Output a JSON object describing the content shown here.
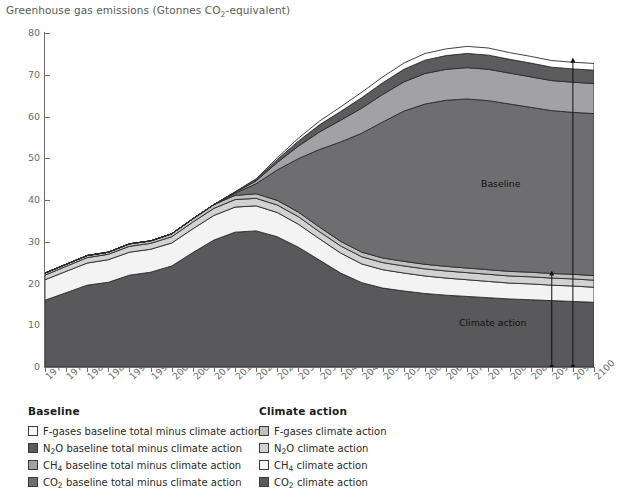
{
  "chart_data": {
    "type": "area",
    "title": "Greenhouse gas emissions (Gtonnes CO2-equivalent)",
    "title_rich": {
      "pre": "Greenhouse gas emissions (Gtonnes CO",
      "sub": "2",
      "post": "-equivalent)"
    },
    "xlabel": "",
    "ylabel": "",
    "ylim": [
      0,
      80
    ],
    "xlim": [
      1970,
      2100
    ],
    "ytick_step": 10,
    "yticks": [
      0,
      10,
      20,
      30,
      40,
      50,
      60,
      70,
      80
    ],
    "grid": false,
    "stacked": true,
    "legend_position": "below-plot",
    "x": [
      1970,
      1975,
      1980,
      1985,
      1990,
      1995,
      2000,
      2005,
      2010,
      2015,
      2020,
      2025,
      2030,
      2035,
      2040,
      2045,
      2050,
      2055,
      2060,
      2065,
      2070,
      2075,
      2080,
      2085,
      2090,
      2095,
      2100
    ],
    "xtick_labels": [
      "1970",
      "1975",
      "1980",
      "1985",
      "1990",
      "1995",
      "2000",
      "2005",
      "2010",
      "2015",
      "2020",
      "2025",
      "2030",
      "2035",
      "2040",
      "2045",
      "2050",
      "2055",
      "2060",
      "2065",
      "2070",
      "2075",
      "2080",
      "2085",
      "2090",
      "2095",
      "2100"
    ],
    "series": [
      {
        "name": "CO2 climate action",
        "key": "co2_climate",
        "color": "#59595b",
        "values": [
          16.0,
          17.8,
          19.6,
          20.3,
          22.0,
          22.7,
          24.2,
          27.4,
          30.4,
          32.3,
          32.6,
          31.2,
          28.7,
          25.6,
          22.5,
          20.2,
          18.9,
          18.2,
          17.6,
          17.2,
          16.9,
          16.6,
          16.3,
          16.1,
          15.9,
          15.7,
          15.5
        ]
      },
      {
        "name": "CH4 climate action",
        "key": "ch4_climate",
        "color": "#f3f3f3",
        "values": [
          4.9,
          5.1,
          5.3,
          5.4,
          5.5,
          5.5,
          5.5,
          5.7,
          5.9,
          6.0,
          6.0,
          5.8,
          5.5,
          5.1,
          4.8,
          4.5,
          4.4,
          4.3,
          4.2,
          4.1,
          4.0,
          3.9,
          3.8,
          3.8,
          3.7,
          3.7,
          3.6
        ]
      },
      {
        "name": "N2O climate action",
        "key": "n2o_climate",
        "color": "#d2d2d2",
        "values": [
          1.1,
          1.2,
          1.3,
          1.3,
          1.4,
          1.4,
          1.5,
          1.6,
          1.7,
          1.8,
          1.8,
          1.8,
          1.8,
          1.7,
          1.7,
          1.7,
          1.7,
          1.7,
          1.7,
          1.7,
          1.7,
          1.7,
          1.7,
          1.7,
          1.7,
          1.7,
          1.7
        ]
      },
      {
        "name": "F-gases climate action",
        "key": "fgas_climate",
        "color": "#c0c0c0",
        "values": [
          0.5,
          0.5,
          0.5,
          0.5,
          0.6,
          0.6,
          0.7,
          0.8,
          0.9,
          1.0,
          1.1,
          1.1,
          1.1,
          1.1,
          1.1,
          1.1,
          1.1,
          1.1,
          1.1,
          1.1,
          1.1,
          1.1,
          1.1,
          1.1,
          1.1,
          1.1,
          1.1
        ]
      },
      {
        "name": "CO2 baseline total minus climate action",
        "key": "co2_baseline_minus",
        "color": "#6e6e70",
        "values": [
          0.0,
          0.0,
          0.0,
          0.0,
          0.0,
          0.0,
          0.0,
          0.0,
          0.0,
          0.5,
          2.4,
          7.3,
          12.8,
          18.6,
          23.8,
          28.5,
          32.6,
          36.0,
          38.4,
          39.8,
          40.5,
          40.5,
          40.1,
          39.5,
          39.0,
          38.8,
          38.8
        ]
      },
      {
        "name": "CH4 baseline total minus climate action",
        "key": "ch4_baseline_minus",
        "color": "#a2a2a4",
        "values": [
          0.0,
          0.0,
          0.0,
          0.0,
          0.0,
          0.0,
          0.0,
          0.0,
          0.0,
          0.2,
          0.7,
          1.8,
          3.0,
          4.2,
          5.2,
          6.0,
          6.6,
          7.0,
          7.3,
          7.4,
          7.5,
          7.5,
          7.4,
          7.3,
          7.2,
          7.2,
          7.2
        ]
      },
      {
        "name": "N2O baseline total minus climate action",
        "key": "n2o_baseline_minus",
        "color": "#5c5c5e",
        "values": [
          0.0,
          0.0,
          0.0,
          0.0,
          0.0,
          0.0,
          0.0,
          0.0,
          0.0,
          0.1,
          0.3,
          0.7,
          1.2,
          1.7,
          2.1,
          2.5,
          2.8,
          3.0,
          3.2,
          3.3,
          3.4,
          3.4,
          3.3,
          3.3,
          3.2,
          3.2,
          3.2
        ]
      },
      {
        "name": "F-gases baseline total minus climate action",
        "key": "fgas_baseline_minus",
        "color": "#ffffff",
        "values": [
          0.0,
          0.0,
          0.0,
          0.0,
          0.0,
          0.0,
          0.0,
          0.0,
          0.0,
          0.05,
          0.2,
          0.4,
          0.7,
          0.9,
          1.1,
          1.3,
          1.4,
          1.5,
          1.6,
          1.6,
          1.7,
          1.7,
          1.6,
          1.6,
          1.6,
          1.6,
          1.6
        ]
      }
    ],
    "annotations": [
      {
        "name": "baseline-label",
        "text": "Baseline",
        "x": 2079,
        "y": 45.5
      },
      {
        "name": "climate-action-label",
        "text": "Climate action",
        "x": 2074,
        "y": 12.5
      },
      {
        "name": "baseline-arrow",
        "kind": "double-arrow",
        "x": 2095,
        "y_from": 0,
        "y_to": 73.5
      },
      {
        "name": "climate-action-arrow",
        "kind": "double-arrow",
        "x": 2090,
        "y_from": 0,
        "y_to": 22.5
      }
    ]
  },
  "legend": {
    "baseline": {
      "heading": "Baseline",
      "items": [
        {
          "label_pre": "F-gases baseline total minus climate action",
          "sub": "",
          "label_post": "",
          "color": "#ffffff",
          "border": "#3a3a3a"
        },
        {
          "label_pre": "N",
          "sub": "2",
          "label_post": "O baseline total minus climate action",
          "color": "#5c5c5e",
          "border": "#3a3a3a"
        },
        {
          "label_pre": "CH",
          "sub": "4",
          "label_post": " baseline total minus climate action",
          "color": "#a2a2a4",
          "border": "#3a3a3a"
        },
        {
          "label_pre": "CO",
          "sub": "2",
          "label_post": " baseline total minus climate action",
          "color": "#6e6e70",
          "border": "#3a3a3a"
        }
      ]
    },
    "climate_action": {
      "heading": "Climate action",
      "items": [
        {
          "label_pre": "F-gases climate action",
          "sub": "",
          "label_post": "",
          "color": "#c0c0c0",
          "border": "#3a3a3a"
        },
        {
          "label_pre": "N",
          "sub": "2",
          "label_post": "O climate action",
          "color": "#d2d2d2",
          "border": "#3a3a3a"
        },
        {
          "label_pre": "CH",
          "sub": "4",
          "label_post": " climate action",
          "color": "#f6f6f6",
          "border": "#3a3a3a"
        },
        {
          "label_pre": "CO",
          "sub": "2",
          "label_post": " climate action",
          "color": "#59595b",
          "border": "#3a3a3a"
        }
      ]
    }
  },
  "colors": {
    "axis": "#6d6d6d",
    "tick_text": "#6a6a6a",
    "title_text": "#5a5a5a",
    "annotation_text": "#111111",
    "stack_outline": "#2b2b2b",
    "background": "#ffffff"
  }
}
